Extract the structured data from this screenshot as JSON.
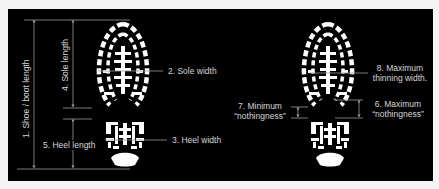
{
  "diagram": {
    "background_color": "#000000",
    "line_color": "#9a9a9a",
    "text_color": "#d6d6d6",
    "left_figure": {
      "labels": {
        "shoe_length": "1. Shoe / boot length",
        "sole_width": "2. Sole width",
        "heel_width": "3. Heel width",
        "sole_length": "4. Sole length",
        "heel_length": "5. Heel length"
      }
    },
    "right_figure": {
      "labels": {
        "max_nothingness_line1": "6. Maximum",
        "max_nothingness_line2": "“nothingness”",
        "min_nothingness_line1": "7. Minimum",
        "min_nothingness_line2": "“nothingness”",
        "max_thinning_line1": "8. Maximum",
        "max_thinning_line2": "thinning width."
      }
    }
  }
}
